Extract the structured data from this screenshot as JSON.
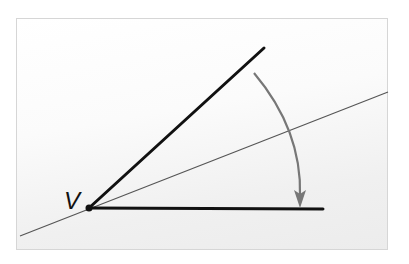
{
  "diagram": {
    "type": "angle-rotation",
    "vertex": {
      "label": "V",
      "x": 89,
      "y": 208
    },
    "rays": [
      {
        "name": "initial-side",
        "from": [
          89,
          208
        ],
        "to": [
          264,
          48
        ],
        "color": "#111111",
        "width": 3
      },
      {
        "name": "terminal-side",
        "from": [
          89,
          208
        ],
        "to": [
          323,
          209
        ],
        "color": "#111111",
        "width": 3
      }
    ],
    "bisector_line": {
      "from": [
        20,
        236
      ],
      "to": [
        388,
        92
      ],
      "color": "#555555",
      "width": 1.2
    },
    "rotation_arrow": {
      "path": "M 254 73 Q 302 130 300 196",
      "arrowhead_tip": [
        300,
        207
      ],
      "color": "#777777",
      "direction": "clockwise"
    },
    "frame": {
      "border_color": "#d6d6d6"
    }
  }
}
